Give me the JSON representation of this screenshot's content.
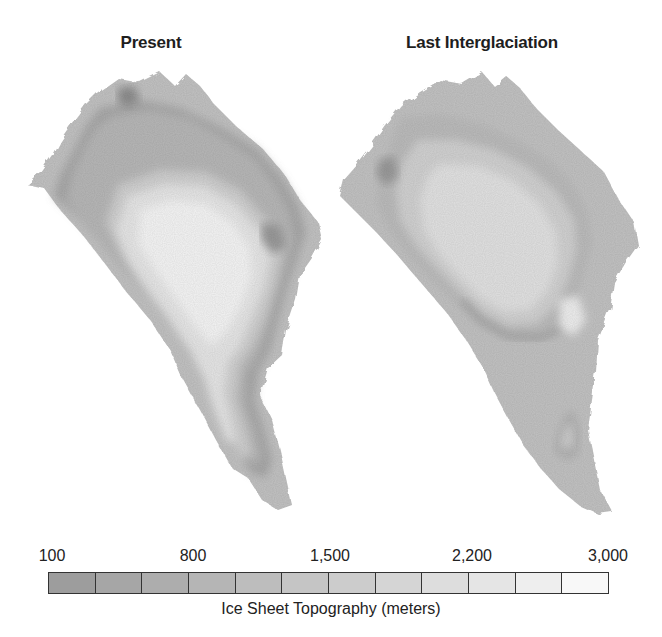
{
  "figure": {
    "panels": [
      {
        "id": "present",
        "title": "Present"
      },
      {
        "id": "last_interglaciation",
        "title": "Last Interglaciation"
      }
    ]
  },
  "legend": {
    "caption": "Ice Sheet Topography (meters)",
    "tick_labels": [
      "100",
      "800",
      "1,500",
      "2,200",
      "3,000"
    ],
    "swatch_count": 12,
    "swatch_colors": [
      "#9d9d9d",
      "#a6a6a6",
      "#adadad",
      "#b5b5b5",
      "#bdbdbd",
      "#c5c5c5",
      "#cccccc",
      "#d5d5d5",
      "#dddddd",
      "#e5e5e5",
      "#eeeeee",
      "#f8f8f8"
    ],
    "land_color": "#c3c3c3"
  }
}
